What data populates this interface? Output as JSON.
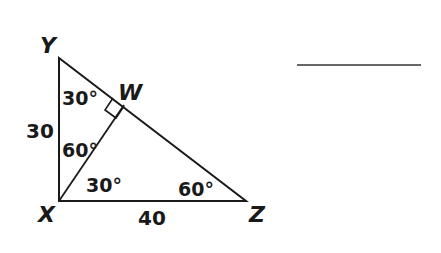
{
  "diagram": {
    "vertices": {
      "Y": "Y",
      "W": "W",
      "X": "X",
      "Z": "Z"
    },
    "sides": {
      "XY": "30",
      "XZ": "40"
    },
    "angles": {
      "Y": "30°",
      "YXW": "60°",
      "WXZ": "30°",
      "Z": "60°"
    },
    "right_angle_at": "W",
    "answer_blank": ""
  },
  "colors": {
    "stroke": "#1a1a1a",
    "background": "#ffffff"
  }
}
